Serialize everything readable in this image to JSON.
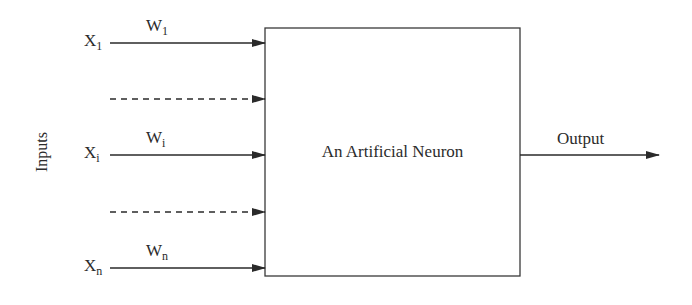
{
  "diagram": {
    "title": "An Artificial Neuron",
    "side_label": "Inputs",
    "output_label": "Output",
    "inputs": [
      {
        "x_label": "X",
        "x_sub": "1",
        "w_label": "W",
        "w_sub": "1",
        "style": "solid"
      },
      {
        "style": "dashed"
      },
      {
        "x_label": "X",
        "x_sub": "i",
        "w_label": "W",
        "w_sub": "i",
        "style": "solid"
      },
      {
        "style": "dashed"
      },
      {
        "x_label": "X",
        "x_sub": "n",
        "w_label": "W",
        "w_sub": "n",
        "style": "solid"
      }
    ],
    "colors": {
      "line": "#2a2a2a",
      "background": "#ffffff"
    }
  }
}
